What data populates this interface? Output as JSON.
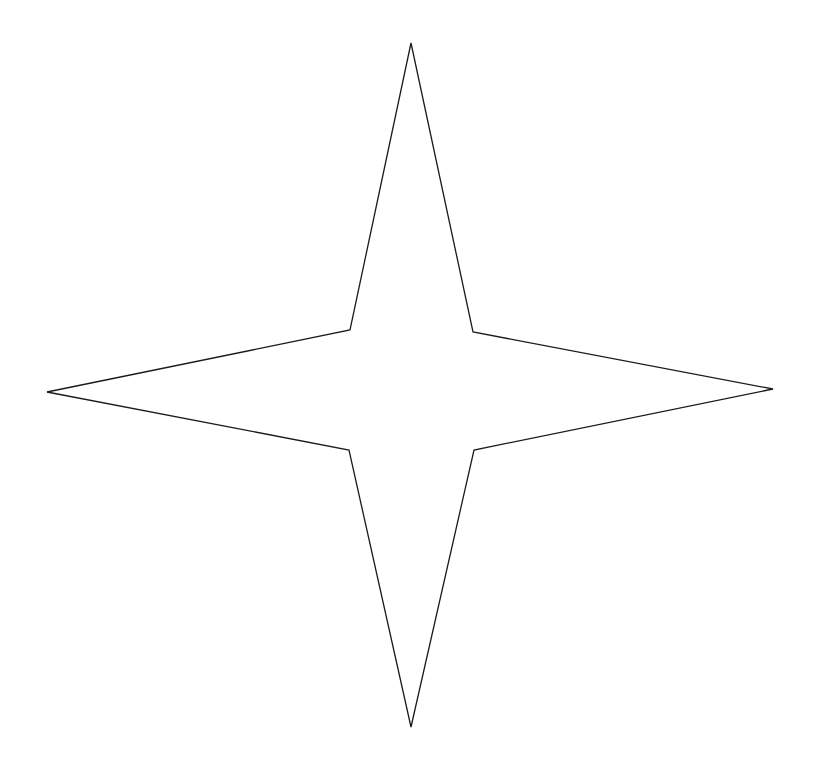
{
  "canvas": {
    "width": 821,
    "height": 764,
    "background": "#ffffff"
  },
  "star": {
    "shape": "four-pointed-star",
    "stroke": "#1a1a1a",
    "fill": "none",
    "stroke_width": 1.3,
    "points": [
      [
        411,
        43
      ],
      [
        473,
        332
      ],
      [
        773,
        389
      ],
      [
        474,
        450
      ],
      [
        411,
        727
      ],
      [
        349,
        450
      ],
      [
        47,
        392
      ],
      [
        350,
        330
      ]
    ]
  }
}
